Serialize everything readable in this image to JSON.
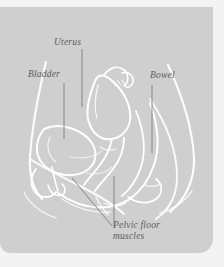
{
  "figure": {
    "kind": "anatomical-illustration",
    "panel_color": "#cfcfcf",
    "page_color": "#f3f3f3",
    "line_color": "#ffffff",
    "label_color": "#5c5c5c",
    "leader_color": "#7d7d7d"
  },
  "labels": {
    "uterus": "Uterus",
    "bladder": "Bladder",
    "bowel": "Bowel",
    "pelvic_floor_line1": "Pelvic floor",
    "pelvic_floor_line2": "muscles"
  }
}
